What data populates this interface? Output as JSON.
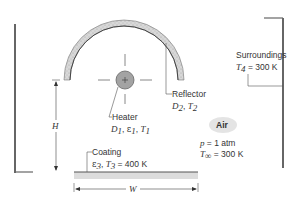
{
  "diagram": {
    "type": "radiant heater schematic",
    "labels": {
      "surroundings_title": "Surroundings",
      "surroundings_T_symbol": "T",
      "surroundings_T_sub": "4",
      "surroundings_T_value": " = 300 K",
      "reflector_title": "Reflector",
      "reflector_D": "D",
      "reflector_D_sub": "2",
      "reflector_sep": ", ",
      "reflector_T": "T",
      "reflector_T_sub": "2",
      "heater_title": "Heater",
      "heater_D": "D",
      "heater_D_sub": "1",
      "heater_eps": "ε",
      "heater_eps_sub": "1",
      "heater_T": "T",
      "heater_T_sub": "1",
      "heater_sep": ", ",
      "air_badge": "Air",
      "air_p_symbol": "p",
      "air_p_value": " = 1 atm",
      "air_T_symbol": "T",
      "air_T_sub": "∞",
      "air_T_value": " = 300 K",
      "coating_title": "Coating",
      "coating_eps": "ε",
      "coating_eps_sub": "3",
      "coating_T": "T",
      "coating_T_sub": "3",
      "coating_T_value": " = 400 K",
      "coating_sep": ", ",
      "height_dim": "H",
      "width_dim": "W"
    },
    "colors": {
      "line": "#555555",
      "heater_fill": "#9a9a9a",
      "reflector_fill": "#cfcfcf",
      "coating_fill": "#d9d9d9",
      "air_badge_fill": "#e6e6e6"
    }
  }
}
